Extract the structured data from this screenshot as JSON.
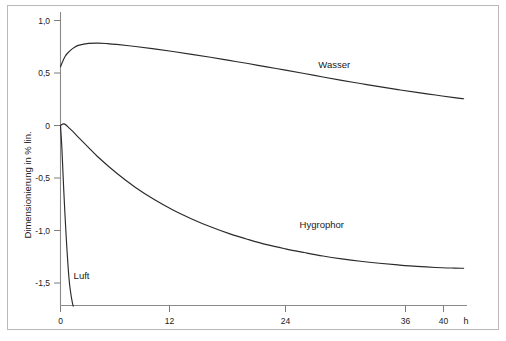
{
  "chart_data": {
    "type": "line",
    "title": "",
    "subtitle": "",
    "xlabel": "h",
    "ylabel": "Dimensionierung in % lin.",
    "xlim": [
      -1,
      44
    ],
    "ylim": [
      -1.72,
      1.12
    ],
    "grid": false,
    "legend_position": "inline-annotations",
    "x_ticks": [
      {
        "value": 0,
        "label": "0"
      },
      {
        "value": 12,
        "label": "12"
      },
      {
        "value": 24,
        "label": "24"
      },
      {
        "value": 36,
        "label": "36"
      },
      {
        "value": 40,
        "label": "40"
      }
    ],
    "y_ticks": [
      {
        "value": 1.0,
        "label": "1,0"
      },
      {
        "value": 0.5,
        "label": "0,5"
      },
      {
        "value": 0.0,
        "label": "0"
      },
      {
        "value": -0.5,
        "label": "-0,5"
      },
      {
        "value": -1.0,
        "label": "-1,0"
      },
      {
        "value": -1.5,
        "label": "-1,5"
      }
    ],
    "series": [
      {
        "name": "Wasser",
        "label": "Wasser",
        "color": "#2a2a2a",
        "annotation": {
          "x": 27.5,
          "y": 0.55
        },
        "x": [
          0,
          0.5,
          1,
          1.5,
          2,
          3,
          4,
          5,
          6,
          8,
          10,
          12,
          14,
          16,
          18,
          20,
          22,
          24,
          26,
          28,
          30,
          32,
          34,
          36,
          38,
          40,
          42,
          43
        ],
        "y": [
          0.56,
          0.66,
          0.71,
          0.745,
          0.765,
          0.782,
          0.785,
          0.78,
          0.772,
          0.752,
          0.73,
          0.705,
          0.678,
          0.65,
          0.62,
          0.59,
          0.558,
          0.527,
          0.495,
          0.462,
          0.43,
          0.4,
          0.37,
          0.342,
          0.315,
          0.29,
          0.265,
          0.255
        ]
      },
      {
        "name": "Hygrophor",
        "label": "Hygrophor",
        "color": "#2a2a2a",
        "annotation": {
          "x": 25.5,
          "y": -0.98
        },
        "x": [
          0,
          0.4,
          1,
          2,
          3,
          4,
          6,
          8,
          10,
          12,
          14,
          16,
          18,
          20,
          22,
          24,
          26,
          28,
          30,
          32,
          34,
          36,
          38,
          40,
          42,
          43
        ],
        "y": [
          0.0,
          0.015,
          -0.03,
          -0.12,
          -0.21,
          -0.3,
          -0.455,
          -0.59,
          -0.705,
          -0.805,
          -0.89,
          -0.965,
          -1.03,
          -1.085,
          -1.135,
          -1.175,
          -1.21,
          -1.243,
          -1.27,
          -1.293,
          -1.312,
          -1.328,
          -1.342,
          -1.352,
          -1.358,
          -1.36
        ]
      },
      {
        "name": "Luft",
        "label": "Luft",
        "color": "#2a2a2a",
        "annotation": {
          "x": 1.4,
          "y": -1.46
        },
        "x": [
          0,
          0.15,
          0.35,
          0.6,
          0.9,
          1.1,
          1.25,
          1.35
        ],
        "y": [
          0.0,
          -0.22,
          -0.62,
          -1.05,
          -1.45,
          -1.6,
          -1.68,
          -1.72
        ]
      }
    ]
  }
}
